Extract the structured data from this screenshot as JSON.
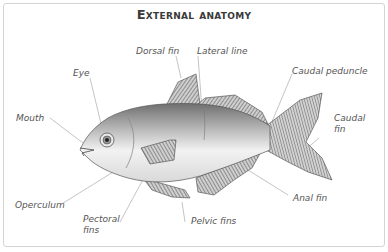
{
  "title": "External anatomy",
  "labels": {
    "dorsal_fin": "Dorsal fin",
    "lateral_line": "Lateral line",
    "caudal_peduncle": "Caudal peduncle",
    "eye": "Eye",
    "mouth": "Mouth",
    "caudal_fin_1": "Caudal",
    "caudal_fin_2": "fin",
    "operculum": "Operculum",
    "pectoral_fins_1": "Pectoral",
    "pectoral_fins_2": "fins",
    "pelvic_fins": "Pelvic fins",
    "anal_fin": "Anal fin"
  },
  "colors": {
    "frame_border": "#d4d4d4",
    "label_text": "#555555",
    "leader_line": "#b5b5b5",
    "fin_stroke": "#3c3c3c"
  }
}
